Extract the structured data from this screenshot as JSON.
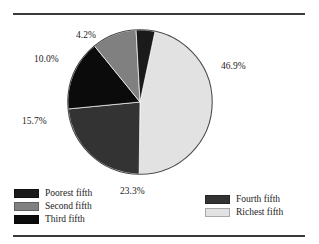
{
  "figure": {
    "has_top_rule": true,
    "has_bottom_rule": true,
    "rule_color": "#3a3a3a",
    "background": "#ffffff"
  },
  "chart_data": {
    "type": "pie",
    "title": "",
    "subtitle": "",
    "xlabel": "",
    "ylabel": "",
    "grid": false,
    "legend_position": "bottom",
    "start_angle_deg": 12,
    "direction": "clockwise",
    "categories": [
      "Richest fifth",
      "Fourth fifth",
      "Third fifth",
      "Second fifth",
      "Poorest fifth"
    ],
    "values": [
      46.9,
      23.3,
      15.7,
      10.0,
      4.2
    ],
    "value_labels": [
      "46.9%",
      "23.3%",
      "15.7%",
      "10.0%",
      "4.2%"
    ],
    "colors": [
      "#e2e2e2",
      "#333333",
      "#0b0b0b",
      "#808080",
      "#1a1a1a"
    ],
    "slices": [
      {
        "label": "Richest fifth",
        "value": 46.9,
        "display": "46.9%",
        "color": "#e2e2e2"
      },
      {
        "label": "Fourth fifth",
        "value": 23.3,
        "display": "23.3%",
        "color": "#333333"
      },
      {
        "label": "Third fifth",
        "value": 15.7,
        "display": "15.7%",
        "color": "#0b0b0b"
      },
      {
        "label": "Second fifth",
        "value": 10.0,
        "display": "10.0%",
        "color": "#808080"
      },
      {
        "label": "Poorest fifth",
        "value": 4.2,
        "display": "4.2%",
        "color": "#1a1a1a"
      }
    ]
  },
  "labels": {
    "richest": "46.9%",
    "fourth": "23.3%",
    "third": "15.7%",
    "second": "10.0%",
    "poorest": "4.2%"
  },
  "legend": {
    "left_column": [
      {
        "label": "Poorest fifth",
        "color": "#1a1a1a"
      },
      {
        "label": "Second fifth",
        "color": "#808080"
      },
      {
        "label": "Third fifth",
        "color": "#0b0b0b"
      }
    ],
    "right_column": [
      {
        "label": "Fourth fifth",
        "color": "#333333"
      },
      {
        "label": "Richest fifth",
        "color": "#e2e2e2"
      }
    ]
  }
}
